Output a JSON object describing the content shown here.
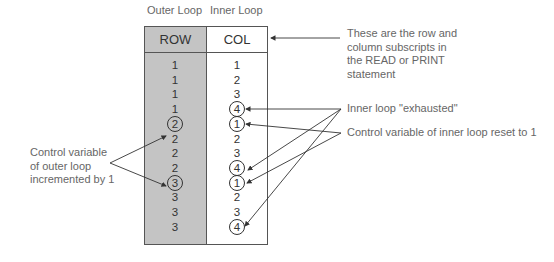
{
  "labels": {
    "outer_loop": "Outer Loop",
    "inner_loop": "Inner Loop"
  },
  "table": {
    "headers": {
      "row": "ROW",
      "col": "COL"
    },
    "rows": [
      {
        "row": "1",
        "col": "1",
        "row_circled": false,
        "col_circled": false
      },
      {
        "row": "1",
        "col": "2",
        "row_circled": false,
        "col_circled": false
      },
      {
        "row": "1",
        "col": "3",
        "row_circled": false,
        "col_circled": false
      },
      {
        "row": "1",
        "col": "4",
        "row_circled": false,
        "col_circled": true
      },
      {
        "row": "2",
        "col": "1",
        "row_circled": true,
        "col_circled": true
      },
      {
        "row": "2",
        "col": "2",
        "row_circled": false,
        "col_circled": false
      },
      {
        "row": "2",
        "col": "3",
        "row_circled": false,
        "col_circled": false
      },
      {
        "row": "2",
        "col": "4",
        "row_circled": false,
        "col_circled": true
      },
      {
        "row": "3",
        "col": "1",
        "row_circled": true,
        "col_circled": true
      },
      {
        "row": "3",
        "col": "2",
        "row_circled": false,
        "col_circled": false
      },
      {
        "row": "3",
        "col": "3",
        "row_circled": false,
        "col_circled": false
      },
      {
        "row": "3",
        "col": "4",
        "row_circled": false,
        "col_circled": true
      }
    ]
  },
  "annotations": {
    "subscripts": [
      "These are the row and",
      "column subscripts in",
      "the READ or PRINT",
      "statement"
    ],
    "exhausted": "Inner loop \"exhausted\"",
    "reset": "Control variable of inner loop reset to 1",
    "outer_increment": [
      "Control variable",
      "of outer loop",
      "incremented by 1"
    ]
  },
  "colors": {
    "shaded_column": "#c4c4c4",
    "lines": "#333333",
    "annotation_text": "#666666"
  }
}
